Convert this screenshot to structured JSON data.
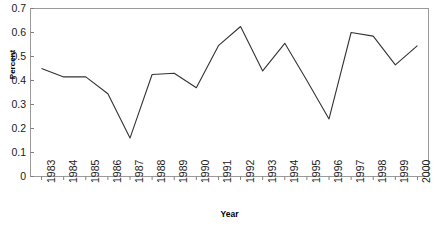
{
  "chart_data": {
    "type": "line",
    "title": "",
    "xlabel": "Year",
    "ylabel": "Percent",
    "categories": [
      "1983",
      "1984",
      "1985",
      "1986",
      "1987",
      "1988",
      "1989",
      "1990",
      "1991",
      "1992",
      "1993",
      "1994",
      "1995",
      "1996",
      "1997",
      "1998",
      "1999",
      "2000"
    ],
    "values": [
      0.45,
      0.415,
      0.415,
      0.345,
      0.16,
      0.425,
      0.43,
      0.37,
      0.545,
      0.625,
      0.44,
      0.555,
      0.4,
      0.24,
      0.6,
      0.585,
      0.465,
      0.545
    ],
    "series": [
      {
        "name": "Percent",
        "values": [
          0.45,
          0.415,
          0.415,
          0.345,
          0.16,
          0.425,
          0.43,
          0.37,
          0.545,
          0.625,
          0.44,
          0.555,
          0.4,
          0.24,
          0.6,
          0.585,
          0.465,
          0.545
        ]
      }
    ],
    "ylim": [
      0,
      0.7
    ],
    "yticks": [
      "0",
      "0.1",
      "0.2",
      "0.3",
      "0.4",
      "0.5",
      "0.6",
      "0.7"
    ],
    "ytick_values": [
      0,
      0.1,
      0.2,
      0.3,
      0.4,
      0.5,
      0.6,
      0.7
    ],
    "xtick_labels": [
      "1983",
      "1984",
      "1985",
      "1986",
      "1987",
      "1988",
      "1989",
      "1990",
      "1991",
      "1992",
      "1993",
      "1994",
      "1995",
      "1996",
      "1997",
      "1998",
      "1999",
      "2000"
    ],
    "grid": false,
    "legend": "none",
    "line_color": "#333333",
    "axis_color": "#808080",
    "background_color": "#ffffff",
    "plot_border": "box"
  }
}
